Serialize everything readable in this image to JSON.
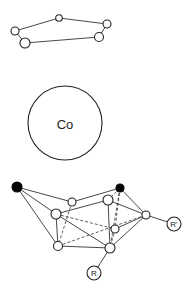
{
  "diagram": {
    "title": "",
    "top_ring": {
      "nodes": [
        {
          "id": "t1",
          "x": 15,
          "y": 31,
          "r": 4
        },
        {
          "id": "t2",
          "x": 59,
          "y": 18,
          "r": 3.3
        },
        {
          "id": "t3",
          "x": 107,
          "y": 24,
          "r": 4
        },
        {
          "id": "t4",
          "x": 99,
          "y": 37,
          "r": 4.5
        },
        {
          "id": "t5",
          "x": 25,
          "y": 43,
          "r": 5
        }
      ],
      "edges": [
        [
          "t1",
          "t2"
        ],
        [
          "t2",
          "t3"
        ],
        [
          "t3",
          "t4"
        ],
        [
          "t4",
          "t5"
        ],
        [
          "t5",
          "t1"
        ]
      ]
    },
    "metal": {
      "label": "Co",
      "x": 65,
      "y": 123,
      "r": 37
    },
    "bottom_cage": {
      "nodes": [
        {
          "id": "b1",
          "x": 17,
          "y": 187,
          "r": 5,
          "type": "black"
        },
        {
          "id": "b2",
          "x": 120,
          "y": 188,
          "r": 4,
          "type": "black"
        },
        {
          "id": "a",
          "x": 72,
          "y": 202,
          "r": 4,
          "type": "open"
        },
        {
          "id": "b",
          "x": 56,
          "y": 214,
          "r": 5,
          "type": "open"
        },
        {
          "id": "c",
          "x": 108,
          "y": 200,
          "r": 5,
          "type": "open"
        },
        {
          "id": "d",
          "x": 146,
          "y": 215,
          "r": 4,
          "type": "open"
        },
        {
          "id": "e",
          "x": 115,
          "y": 229,
          "r": 4,
          "type": "open"
        },
        {
          "id": "f",
          "x": 58,
          "y": 246,
          "r": 4.5,
          "type": "open"
        },
        {
          "id": "g",
          "x": 110,
          "y": 248,
          "r": 5,
          "type": "open"
        }
      ],
      "edges": [
        [
          "b1",
          "a"
        ],
        [
          "b1",
          "b"
        ],
        [
          "b1",
          "f"
        ],
        [
          "a",
          "b2"
        ],
        [
          "b",
          "c"
        ],
        [
          "b2",
          "d"
        ],
        [
          "c",
          "d"
        ],
        [
          "b",
          "f"
        ],
        [
          "b",
          "g"
        ],
        [
          "f",
          "g"
        ],
        [
          "c",
          "g"
        ],
        [
          "g",
          "d"
        ],
        [
          "d",
          "e"
        ]
      ],
      "dashed_edges": [
        [
          "a",
          "f"
        ],
        [
          "b",
          "e"
        ],
        [
          "b2",
          "c"
        ],
        [
          "b2",
          "e"
        ],
        [
          "b2",
          "g"
        ],
        [
          "f",
          "d"
        ],
        [
          "e",
          "g"
        ]
      ],
      "substituents": [
        {
          "label": "R",
          "x": 94,
          "y": 273,
          "r": 7,
          "attach": "g"
        },
        {
          "label": "R'",
          "x": 174,
          "y": 224,
          "r": 7,
          "attach": "d"
        }
      ]
    }
  }
}
